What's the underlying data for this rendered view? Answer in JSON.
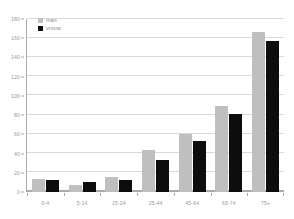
{
  "chart_data": {
    "type": "bar",
    "title": "",
    "xlabel": "",
    "ylabel": "",
    "categories": [
      "0-4",
      "5-14",
      "15-24",
      "25-44",
      "45-64",
      "65-74",
      "75+"
    ],
    "series": [
      {
        "name": "man",
        "color": "#bfbfbf",
        "values": [
          14,
          7,
          16,
          44,
          60,
          89,
          167
        ]
      },
      {
        "name": "vrouw",
        "color": "#0d0d0d",
        "values": [
          12,
          10,
          13,
          33,
          53,
          81,
          157
        ]
      }
    ],
    "ylim": [
      0,
      180
    ],
    "ytick_step": 20,
    "yticks": [
      0,
      20,
      40,
      60,
      80,
      100,
      120,
      140,
      160,
      180
    ],
    "ytick_labels": [
      "0",
      "20",
      "40",
      "60",
      "80",
      "100",
      "120",
      "140",
      "160",
      "180"
    ],
    "grid": true,
    "grid_axis": "y",
    "legend_position": "top-left",
    "background": "#ffffff",
    "axis_color": "#aaaaaa",
    "grid_color": "#d9d9d9"
  },
  "legend": {
    "items": [
      {
        "label": "man",
        "swatch": "male-swatch"
      },
      {
        "label": "vrouw",
        "swatch": "female-swatch"
      }
    ]
  }
}
